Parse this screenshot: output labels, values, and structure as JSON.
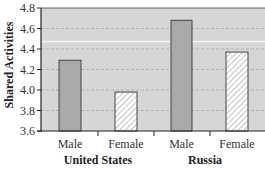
{
  "chart_data": {
    "type": "bar",
    "title": "",
    "xlabel": "",
    "ylabel": "Shared Activities",
    "ylim": [
      3.6,
      4.8
    ],
    "yticks": [
      "3.6",
      "3.8",
      "4.0",
      "4.2",
      "4.4",
      "4.6",
      "4.8"
    ],
    "grid": "dashed horizontal",
    "groups": [
      {
        "name": "United States",
        "categories": [
          "Male",
          "Female"
        ],
        "values": [
          4.29,
          3.98
        ]
      },
      {
        "name": "Russia",
        "categories": [
          "Male",
          "Female"
        ],
        "values": [
          4.68,
          4.37
        ]
      }
    ],
    "categories": [
      "Male",
      "Female",
      "Male",
      "Female"
    ],
    "values": [
      4.29,
      3.98,
      4.68,
      4.37
    ],
    "series_style": {
      "Male": "solid gray",
      "Female": "white with diagonal hatch"
    },
    "colors": {
      "plot_bg": "#d6d6d6",
      "male_bar": "#a9a9a9",
      "female_bar": "#ffffff",
      "axis": "#222222",
      "grid": "#aaaaaa"
    }
  }
}
